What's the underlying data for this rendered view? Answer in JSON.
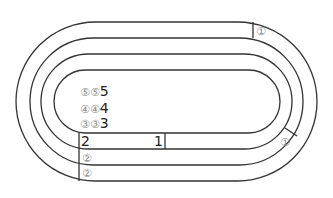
{
  "diagram": {
    "type": "running-track",
    "lanes": 3,
    "stroke_color": "#333333",
    "markers": {
      "top_right": "①",
      "right_curve": "①",
      "lane_start_2a": "②",
      "lane_start_2b": "②",
      "start_box_left": "2",
      "start_box_right": "1"
    },
    "infield_rows": [
      {
        "c1": "⑤",
        "c2": "⑤",
        "n": "5"
      },
      {
        "c1": "④",
        "c2": "④",
        "n": "4"
      },
      {
        "c1": "③",
        "c2": "③",
        "n": "3"
      }
    ]
  }
}
